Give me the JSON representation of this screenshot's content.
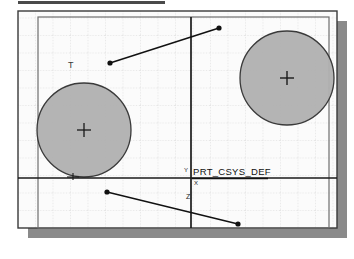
{
  "window": {
    "title_bar_present": true,
    "background_color": "#ffffff",
    "frame_border_color": "#3a3a3a",
    "shadow_color": "#8a8a8a",
    "paper_color": "#fbfbfb"
  },
  "viewport": {
    "outer_frame": {
      "x": 18,
      "y": 11,
      "width": 319,
      "height": 217
    },
    "inner_rect": {
      "x": 38,
      "y": 17,
      "width": 291,
      "height": 211
    },
    "shadow_offset": 10
  },
  "grid": {
    "visible": true,
    "spacing_px": 17.5,
    "line_color": "#c9c9c9",
    "style": "dotted"
  },
  "axes": {
    "color": "#1a1a1a",
    "vertical": {
      "x": 191,
      "y1": 17,
      "y2": 228,
      "label": "Y"
    },
    "horizontal": {
      "y": 178,
      "x1": 18,
      "x2": 337,
      "label": "X"
    },
    "origin": {
      "x": 191,
      "y": 178
    }
  },
  "coordinate_system": {
    "label": "PRT_CSYS_DEF",
    "label_x": 193,
    "label_y": 175,
    "tick_labels": [
      "X",
      "Y",
      "Z"
    ],
    "underline": true
  },
  "features": [
    {
      "name": "circle-left",
      "type": "circle",
      "cx": 84,
      "cy": 130,
      "r": 47,
      "fill": "#b0b0b0",
      "stroke": "#3a3a3a",
      "center_marker": "cross",
      "tag": "T",
      "tag_x": 68,
      "tag_y": 68
    },
    {
      "name": "circle-right",
      "type": "circle",
      "cx": 287,
      "cy": 78,
      "r": 47,
      "fill": "#b0b0b0",
      "stroke": "#3a3a3a",
      "center_marker": "cross",
      "tag": "",
      "tag_x": 0,
      "tag_y": 0
    }
  ],
  "leader_lines": [
    {
      "name": "leader-upper",
      "x1": 110,
      "y1": 63,
      "x2": 219,
      "y2": 28,
      "dot_start": true,
      "dot_end": true,
      "color": "#111111"
    },
    {
      "name": "leader-lower",
      "x1": 107,
      "y1": 192,
      "x2": 238,
      "y2": 224,
      "dot_start": true,
      "dot_end": true,
      "color": "#111111"
    }
  ],
  "markers": [
    {
      "name": "marker-circle-left-bottom",
      "x": 73,
      "y": 177,
      "glyph": "⊥"
    }
  ],
  "title_bar": {
    "x": 18,
    "y": 1,
    "width": 147,
    "height": 3,
    "color": "#4a4a4a"
  }
}
